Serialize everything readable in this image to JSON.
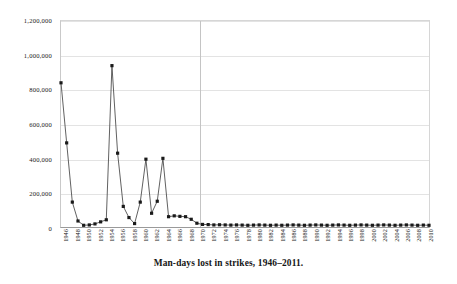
{
  "chart_data": {
    "type": "line",
    "title": "",
    "caption": "Man-days lost in strikes, 1946–2011.",
    "xlabel": "",
    "ylabel": "",
    "ylim": [
      0,
      1200000
    ],
    "xlim": [
      1946,
      2011
    ],
    "grid": true,
    "legend": false,
    "marker": "square",
    "line_color": "#4d4d4d",
    "marker_color": "#1a1a1a",
    "y_ticks": [
      0,
      200000,
      400000,
      600000,
      800000,
      1000000,
      1200000
    ],
    "y_tick_labels": [
      "0",
      "200,000",
      "400,000",
      "600,000",
      "800,000",
      "1,000,000",
      "1,200,000"
    ],
    "x_tick_labels": [
      "1946",
      "1948",
      "1950",
      "1952",
      "1954",
      "1956",
      "1958",
      "1960",
      "1962",
      "1964",
      "1966",
      "1968",
      "1970",
      "1972",
      "1974",
      "1976",
      "1978",
      "1980",
      "1982",
      "1984",
      "1986",
      "1988",
      "1990",
      "1992",
      "1994",
      "1996",
      "1998",
      "2000",
      "2002",
      "2004",
      "2006",
      "2008",
      "2010"
    ],
    "x_tick_step": 2,
    "divider_x": 1970.5,
    "x": [
      1946,
      1947,
      1948,
      1949,
      1950,
      1951,
      1952,
      1953,
      1954,
      1955,
      1956,
      1957,
      1958,
      1959,
      1960,
      1961,
      1962,
      1963,
      1964,
      1965,
      1966,
      1967,
      1968,
      1969,
      1970,
      1971,
      1972,
      1973,
      1974,
      1975,
      1976,
      1977,
      1978,
      1979,
      1980,
      1981,
      1982,
      1983,
      1984,
      1985,
      1986,
      1987,
      1988,
      1989,
      1990,
      1991,
      1992,
      1993,
      1994,
      1995,
      1996,
      1997,
      1998,
      1999,
      2000,
      2001,
      2002,
      2003,
      2004,
      2005,
      2006,
      2007,
      2008,
      2009,
      2010,
      2011
    ],
    "values": [
      840000,
      490000,
      145000,
      35000,
      10000,
      12000,
      18000,
      30000,
      42000,
      940000,
      430000,
      120000,
      55000,
      20000,
      145000,
      395000,
      80000,
      150000,
      400000,
      60000,
      65000,
      62000,
      60000,
      45000,
      22000,
      15000,
      14000,
      12000,
      13000,
      12000,
      11000,
      12000,
      11000,
      10000,
      11000,
      12000,
      11000,
      10000,
      11000,
      10000,
      11000,
      12000,
      11000,
      10000,
      11000,
      12000,
      11000,
      10000,
      11000,
      12000,
      11000,
      10000,
      11000,
      12000,
      11000,
      10000,
      11000,
      12000,
      11000,
      10000,
      11000,
      12000,
      11000,
      10000,
      11000,
      10000
    ],
    "series_name": "Man-days lost"
  }
}
